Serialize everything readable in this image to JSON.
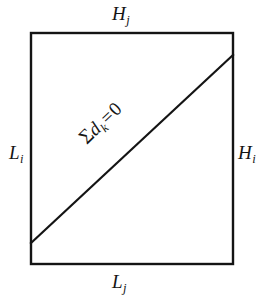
{
  "figure": {
    "background_color": "#ffffff",
    "stroke_color": "#141414",
    "labels": {
      "top": {
        "symbol": "H",
        "subscript": "j",
        "text": "H_j"
      },
      "left": {
        "symbol": "L",
        "subscript": "i",
        "text": "L_i"
      },
      "right": {
        "symbol": "H",
        "subscript": "i",
        "text": "H_i"
      },
      "bottom": {
        "symbol": "L",
        "subscript": "j",
        "text": "L_j"
      },
      "diagonal": {
        "sum_sign": "Σ",
        "symbol": "d",
        "subscript": "k",
        "equals": "=",
        "value": "0",
        "text": "Σd_k = 0"
      }
    },
    "geometry": {
      "rect": {
        "x": 31,
        "y": 33,
        "width": 202,
        "height": 231
      },
      "diagonal_line": {
        "x1": 31,
        "y1": 243,
        "x2": 233,
        "y2": 55
      },
      "border_width": 2.4,
      "diagonal_width": 2.2
    }
  }
}
